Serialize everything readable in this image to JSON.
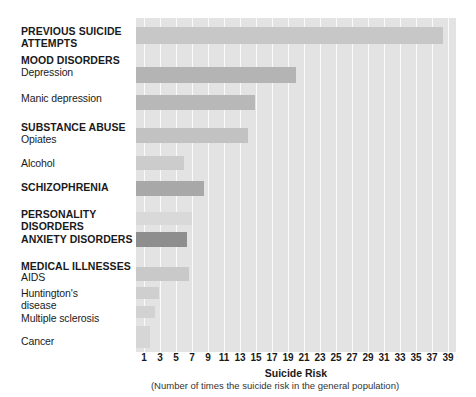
{
  "chart_data": {
    "type": "bar",
    "orientation": "horizontal",
    "title": "",
    "xlabel": "Suicide Risk",
    "xsublabel": "(Number of times the suicide risk in the general population)",
    "ylabel": "",
    "xlim": [
      0,
      40
    ],
    "xticks": [
      1,
      3,
      5,
      7,
      9,
      11,
      13,
      15,
      17,
      19,
      21,
      23,
      25,
      27,
      29,
      31,
      33,
      35,
      37,
      39
    ],
    "grid": true,
    "legend": false,
    "plot_background": "#e3e3e3",
    "gridline_color": "#fafafa",
    "categories": [
      "PREVIOUS SUICIDE ATTEMPTS",
      "Depression",
      "Manic depression",
      "Opiates",
      "Alcohol",
      "SCHIZOPHRENIA",
      "PERSONALITY DISORDERS",
      "ANXIETY DISORDERS",
      "AIDS",
      "Huntington's disease",
      "Multiple sclerosis",
      "Cancer"
    ],
    "values": [
      38.4,
      20.0,
      14.9,
      14.0,
      6.0,
      8.5,
      7.0,
      6.4,
      6.6,
      2.9,
      2.4,
      1.8
    ]
  },
  "labels": [
    {
      "text": "PREVIOUS SUICIDE\nATTEMPTS",
      "bold": true,
      "top": 26
    },
    {
      "text": "MOOD DISORDERS",
      "bold": true,
      "top": 55
    },
    {
      "text": "Depression",
      "bold": false,
      "top": 67
    },
    {
      "text": "Manic depression",
      "bold": false,
      "top": 93
    },
    {
      "text": "SUBSTANCE ABUSE",
      "bold": true,
      "top": 122
    },
    {
      "text": "Opiates",
      "bold": false,
      "top": 134
    },
    {
      "text": "Alcohol",
      "bold": false,
      "top": 158
    },
    {
      "text": "SCHIZOPHRENIA",
      "bold": true,
      "top": 182
    },
    {
      "text": "PERSONALITY\nDISORDERS",
      "bold": true,
      "top": 209
    },
    {
      "text": "ANXIETY DISORDERS",
      "bold": true,
      "top": 234
    },
    {
      "text": "MEDICAL ILLNESSES",
      "bold": true,
      "top": 261
    },
    {
      "text": "AIDS",
      "bold": false,
      "top": 272
    },
    {
      "text": "Huntington's\ndisease",
      "bold": false,
      "top": 288
    },
    {
      "text": "Multiple sclerosis",
      "bold": false,
      "top": 313
    },
    {
      "text": "Cancer",
      "bold": false,
      "top": 336
    }
  ],
  "bars": [
    {
      "name": "previous-suicide-attempts",
      "value": 38.4,
      "top": 9,
      "height": 17,
      "color": "#c7c7c7"
    },
    {
      "name": "depression",
      "value": 20.0,
      "top": 49,
      "height": 16,
      "color": "#b4b4b4"
    },
    {
      "name": "manic-depression",
      "value": 14.9,
      "top": 77,
      "height": 15,
      "color": "#b8b8b8"
    },
    {
      "name": "opiates",
      "value": 14.0,
      "top": 110,
      "height": 15,
      "color": "#c2c2c2"
    },
    {
      "name": "alcohol",
      "value": 6.0,
      "top": 138,
      "height": 14,
      "color": "#cccccc"
    },
    {
      "name": "schizophrenia",
      "value": 8.5,
      "top": 163,
      "height": 15,
      "color": "#a8a8a8"
    },
    {
      "name": "personality-disorders",
      "value": 7.0,
      "top": 194,
      "height": 13,
      "color": "#d9d9d9"
    },
    {
      "name": "anxiety-disorders",
      "value": 6.4,
      "top": 214,
      "height": 15,
      "color": "#8e8e8e"
    },
    {
      "name": "aids",
      "value": 6.6,
      "top": 249,
      "height": 14,
      "color": "#c9c9c9"
    },
    {
      "name": "huntingtons-disease",
      "value": 2.9,
      "top": 269,
      "height": 12,
      "color": "#cfcfcf"
    },
    {
      "name": "multiple-sclerosis",
      "value": 2.4,
      "top": 288,
      "height": 12,
      "color": "#d2d2d2"
    },
    {
      "name": "cancer",
      "value": 1.8,
      "top": 308,
      "height": 22,
      "color": "#d6d6d6"
    }
  ]
}
